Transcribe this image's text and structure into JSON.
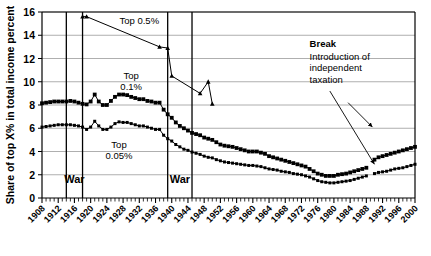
{
  "chart_data": {
    "type": "line",
    "title": "",
    "xlabel": "",
    "ylabel": "Share of top X% in total income percent",
    "xlim": [
      1908,
      2000
    ],
    "ylim": [
      0,
      16
    ],
    "ygrid": true,
    "yticks": [
      0,
      2,
      4,
      6,
      8,
      10,
      12,
      14,
      16
    ],
    "xticks": [
      1908,
      1912,
      1916,
      1920,
      1924,
      1928,
      1932,
      1936,
      1940,
      1944,
      1948,
      1952,
      1956,
      1960,
      1964,
      1968,
      1972,
      1976,
      1980,
      1984,
      1988,
      1992,
      1996,
      2000
    ],
    "legend_position": "inline-annotations",
    "series": [
      {
        "name": "Top 0.5%",
        "label": "Top 0.5%",
        "label_x": 1932,
        "label_y": 15.0,
        "marker": "triangle",
        "x": [
          1918,
          1919,
          1937,
          1939,
          1940,
          1947,
          1949,
          1950
        ],
        "y": [
          15.6,
          15.6,
          13.0,
          12.9,
          10.5,
          9.0,
          10.0,
          8.1
        ]
      },
      {
        "name": "Top 0.1%",
        "label": "Top 0.1%",
        "label_x": 1930,
        "label_y": 10.2,
        "marker": "square",
        "x": [
          1908,
          1909,
          1910,
          1911,
          1912,
          1913,
          1914,
          1915,
          1916,
          1917,
          1918,
          1919,
          1920,
          1921,
          1922,
          1923,
          1924,
          1925,
          1926,
          1927,
          1928,
          1929,
          1930,
          1931,
          1932,
          1933,
          1934,
          1935,
          1936,
          1937,
          1938,
          1939,
          1940,
          1941,
          1942,
          1943,
          1944,
          1945,
          1946,
          1947,
          1948,
          1949,
          1950,
          1951,
          1952,
          1953,
          1954,
          1955,
          1956,
          1957,
          1958,
          1959,
          1960,
          1961,
          1962,
          1963,
          1964,
          1965,
          1966,
          1967,
          1968,
          1969,
          1970,
          1971,
          1972,
          1973,
          1974,
          1975,
          1976,
          1977,
          1978,
          1979,
          1980,
          1981,
          1982,
          1983,
          1984,
          1985,
          1986,
          1987,
          1988,
          1990,
          1991,
          1992,
          1993,
          1994,
          1995,
          1996,
          1997,
          1998,
          1999,
          2000
        ],
        "y": [
          8.15,
          8.2,
          8.25,
          8.3,
          8.3,
          8.3,
          8.3,
          8.35,
          8.3,
          8.2,
          8.1,
          8.05,
          8.3,
          8.9,
          8.3,
          8.0,
          8.0,
          8.35,
          8.7,
          8.9,
          8.9,
          8.85,
          8.7,
          8.6,
          8.5,
          8.5,
          8.35,
          8.3,
          8.2,
          8.2,
          7.6,
          7.2,
          6.9,
          6.5,
          6.2,
          6.0,
          5.8,
          5.6,
          5.5,
          5.4,
          5.2,
          5.1,
          5.0,
          4.8,
          4.6,
          4.5,
          4.45,
          4.4,
          4.3,
          4.2,
          4.1,
          4.0,
          4.0,
          4.0,
          3.9,
          3.8,
          3.6,
          3.5,
          3.4,
          3.3,
          3.2,
          3.1,
          3.0,
          2.9,
          2.8,
          2.7,
          2.5,
          2.3,
          2.1,
          2.0,
          1.9,
          1.9,
          1.9,
          2.0,
          2.05,
          2.1,
          2.2,
          2.3,
          2.4,
          2.5,
          2.6,
          3.3,
          3.5,
          3.6,
          3.7,
          3.8,
          3.9,
          4.0,
          4.1,
          4.2,
          4.3,
          4.4
        ]
      },
      {
        "name": "Top 0.05%",
        "label": "Top 0.05%",
        "label_x": 1927,
        "label_y": 4.3,
        "marker": "square-small",
        "x": [
          1908,
          1909,
          1910,
          1911,
          1912,
          1913,
          1914,
          1915,
          1916,
          1917,
          1918,
          1919,
          1920,
          1921,
          1922,
          1923,
          1924,
          1925,
          1926,
          1927,
          1928,
          1929,
          1930,
          1931,
          1932,
          1933,
          1934,
          1935,
          1936,
          1937,
          1938,
          1939,
          1940,
          1941,
          1942,
          1943,
          1944,
          1945,
          1946,
          1947,
          1948,
          1949,
          1950,
          1951,
          1952,
          1953,
          1954,
          1955,
          1956,
          1957,
          1958,
          1959,
          1960,
          1961,
          1962,
          1963,
          1964,
          1965,
          1966,
          1967,
          1968,
          1969,
          1970,
          1971,
          1972,
          1973,
          1974,
          1975,
          1976,
          1977,
          1978,
          1979,
          1980,
          1981,
          1982,
          1983,
          1984,
          1985,
          1986,
          1987,
          1988,
          1990,
          1991,
          1992,
          1993,
          1994,
          1995,
          1996,
          1997,
          1998,
          1999,
          2000
        ],
        "y": [
          6.1,
          6.15,
          6.2,
          6.25,
          6.3,
          6.3,
          6.3,
          6.3,
          6.25,
          6.2,
          6.1,
          5.9,
          6.1,
          6.6,
          6.2,
          5.9,
          5.9,
          6.1,
          6.4,
          6.55,
          6.5,
          6.5,
          6.4,
          6.3,
          6.2,
          6.2,
          6.1,
          6.0,
          5.9,
          5.9,
          5.4,
          5.1,
          4.9,
          4.6,
          4.4,
          4.2,
          4.1,
          3.95,
          3.85,
          3.75,
          3.6,
          3.5,
          3.45,
          3.3,
          3.2,
          3.1,
          3.05,
          3.0,
          2.95,
          2.9,
          2.85,
          2.8,
          2.8,
          2.75,
          2.7,
          2.6,
          2.5,
          2.45,
          2.4,
          2.3,
          2.25,
          2.2,
          2.1,
          2.05,
          2.0,
          1.9,
          1.8,
          1.65,
          1.5,
          1.4,
          1.35,
          1.3,
          1.3,
          1.35,
          1.4,
          1.45,
          1.5,
          1.6,
          1.7,
          1.8,
          1.9,
          2.1,
          2.2,
          2.25,
          2.3,
          2.4,
          2.5,
          2.55,
          2.6,
          2.7,
          2.8,
          2.9
        ]
      }
    ],
    "vlines": [
      {
        "x": 1914,
        "label": ""
      },
      {
        "x": 1918,
        "label": ""
      },
      {
        "x": 1939,
        "label": ""
      },
      {
        "x": 1945,
        "label": ""
      }
    ],
    "annotations": [
      {
        "name": "war-1",
        "text": "War",
        "x": 1916,
        "y": 1.3
      },
      {
        "name": "war-2",
        "text": "War",
        "x": 1942,
        "y": 1.3
      },
      {
        "name": "break-head",
        "text": "Break",
        "x": 1974,
        "y": 13.0
      },
      {
        "name": "break-l1",
        "text": "Introduction of",
        "x": 1974,
        "y": 11.9
      },
      {
        "name": "break-l2",
        "text": "independent",
        "x": 1974,
        "y": 10.9
      },
      {
        "name": "break-l3",
        "text": "taxation",
        "x": 1974,
        "y": 9.9
      }
    ],
    "arrows": [
      {
        "name": "break-arrow-long",
        "x1": 1979,
        "y1": 9.2,
        "x2": 1990,
        "y2": 2.9
      },
      {
        "name": "break-arrow-short",
        "x1": 1983.5,
        "y1": 8.2,
        "x2": 1989.5,
        "y2": 6.1
      }
    ]
  }
}
